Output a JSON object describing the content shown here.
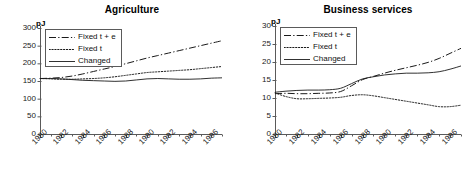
{
  "figure": {
    "unit_label": "pJ",
    "series_names": [
      "Fixed t + e",
      "Fixed t",
      "Changed"
    ],
    "x_tick_labels": [
      "1980",
      "1982",
      "1984",
      "1986",
      "1988",
      "1990",
      "1992",
      "1994",
      "1996"
    ],
    "axis_color": "#5a5a5a",
    "line_color": "#1a1a1a"
  },
  "charts": [
    {
      "title": "Agriculture",
      "y_tick_labels": [
        "300",
        "250",
        "200",
        "150",
        "100",
        "50",
        "0"
      ]
    },
    {
      "title": "Business services",
      "y_tick_labels": [
        "30",
        "25",
        "20",
        "15",
        "10",
        "5",
        "0"
      ]
    }
  ],
  "chart_data": [
    {
      "type": "line",
      "title": "Agriculture",
      "xlabel": "",
      "ylabel": "pJ",
      "ylim": [
        0,
        300
      ],
      "yticks": [
        0,
        50,
        100,
        150,
        200,
        250,
        300
      ],
      "xlim": [
        1980,
        1997
      ],
      "xticks": [
        1980,
        1982,
        1984,
        1986,
        1988,
        1990,
        1992,
        1994,
        1996
      ],
      "x": [
        1980,
        1981,
        1982,
        1983,
        1984,
        1985,
        1986,
        1987,
        1988,
        1989,
        1990,
        1991,
        1992,
        1993,
        1994,
        1995,
        1996,
        1997
      ],
      "grid": false,
      "legend_position": "upper-left",
      "series": [
        {
          "name": "Fixed t + e",
          "style": "dash-dot",
          "values": [
            157,
            158,
            160,
            164,
            170,
            177,
            184,
            191,
            199,
            207,
            215,
            222,
            229,
            236,
            243,
            250,
            257,
            264
          ]
        },
        {
          "name": "Fixed t",
          "style": "dotted",
          "values": [
            157,
            156,
            155,
            155,
            156,
            157,
            159,
            162,
            166,
            170,
            174,
            176,
            178,
            180,
            182,
            185,
            188,
            191
          ]
        },
        {
          "name": "Changed",
          "style": "solid",
          "values": [
            157,
            157,
            156,
            154,
            152,
            151,
            150,
            149,
            150,
            153,
            156,
            157,
            156,
            155,
            155,
            156,
            158,
            159
          ]
        }
      ]
    },
    {
      "type": "line",
      "title": "Business services",
      "xlabel": "",
      "ylabel": "pJ",
      "ylim": [
        0,
        30
      ],
      "yticks": [
        0,
        5,
        10,
        15,
        20,
        25,
        30
      ],
      "xlim": [
        1980,
        1997
      ],
      "xticks": [
        1980,
        1982,
        1984,
        1986,
        1988,
        1990,
        1992,
        1994,
        1996
      ],
      "x": [
        1980,
        1981,
        1982,
        1983,
        1984,
        1985,
        1986,
        1987,
        1988,
        1989,
        1990,
        1991,
        1992,
        1993,
        1994,
        1995,
        1996,
        1997
      ],
      "grid": false,
      "legend_position": "upper-left",
      "series": [
        {
          "name": "Fixed t + e",
          "style": "dash-dot",
          "values": [
            11.2,
            11.3,
            11.2,
            11.2,
            11.3,
            11.4,
            11.8,
            13.4,
            15.1,
            16.0,
            16.9,
            17.7,
            18.4,
            19.1,
            19.9,
            21.0,
            22.4,
            23.8
          ]
        },
        {
          "name": "Fixed t",
          "style": "dotted",
          "values": [
            11.4,
            10.4,
            9.8,
            9.8,
            9.9,
            10.0,
            10.2,
            10.7,
            10.9,
            10.6,
            10.1,
            9.6,
            9.1,
            8.6,
            8.1,
            7.6,
            7.6,
            8.0
          ]
        },
        {
          "name": "Changed",
          "style": "solid",
          "values": [
            11.6,
            11.9,
            12.1,
            12.2,
            12.2,
            12.3,
            12.7,
            14.0,
            15.3,
            15.9,
            16.4,
            16.7,
            16.9,
            16.9,
            17.0,
            17.3,
            18.0,
            18.9
          ]
        }
      ]
    }
  ]
}
